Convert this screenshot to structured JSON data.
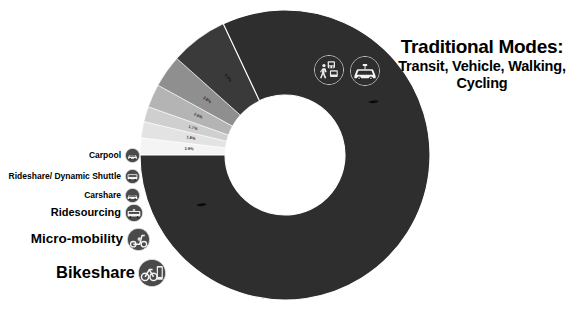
{
  "figure": {
    "background_color": "#ffffff",
    "traditional_label": {
      "heading": "Traditional Modes:",
      "subtext": "Transit, Vehicle, Walking, Cycling"
    }
  },
  "callouts": [
    {
      "label": "Carpool",
      "icon": "carpool-icon"
    },
    {
      "label": "Rideshare/ Dynamic Shuttle",
      "icon": "rideshare-shuttle-icon"
    },
    {
      "label": "Carshare",
      "icon": "carshare-icon"
    },
    {
      "label": "Ridesourcing",
      "icon": "ridesourcing-icon"
    },
    {
      "label": "Micro-mobility",
      "icon": "scooter-icon"
    },
    {
      "label": "Bikeshare",
      "icon": "bikeshare-dock-icon"
    }
  ],
  "ring_badges": [
    {
      "icon": "transit-pedestrian-icon"
    },
    {
      "icon": "car-icon"
    }
  ],
  "chart_data": {
    "type": "pie",
    "title": "",
    "variant": "donut",
    "legend_position": "left-callouts",
    "grid": false,
    "center": [
      285,
      155
    ],
    "outer_radius": 145,
    "inner_radius": 60,
    "start_angle_deg": 180,
    "direction": "clockwise-increasing-downward",
    "categories": [
      "Carpool",
      "Rideshare/ Dynamic Shuttle",
      "Carshare",
      "Ridesourcing",
      "Micro-mobility",
      "Bikeshare",
      "Traditional Modes"
    ],
    "values": [
      1.9,
      1.8,
      1.7,
      2.6,
      3.6,
      6.4,
      82.0
    ],
    "value_labels": [
      "1.9%",
      "1.8%",
      "1.7%",
      "2.6%",
      "3.6%",
      "6.4%",
      ""
    ],
    "colors": [
      "#f4f4f4",
      "#e3e3e3",
      "#cfcfcf",
      "#b4b4b4",
      "#8f8f8f",
      "#3a3a3a",
      "#2e2e2e"
    ],
    "label_text_colors": [
      "#333333",
      "#333333",
      "#333333",
      "#333333",
      "#222222",
      "#111111",
      "#111111"
    ]
  }
}
